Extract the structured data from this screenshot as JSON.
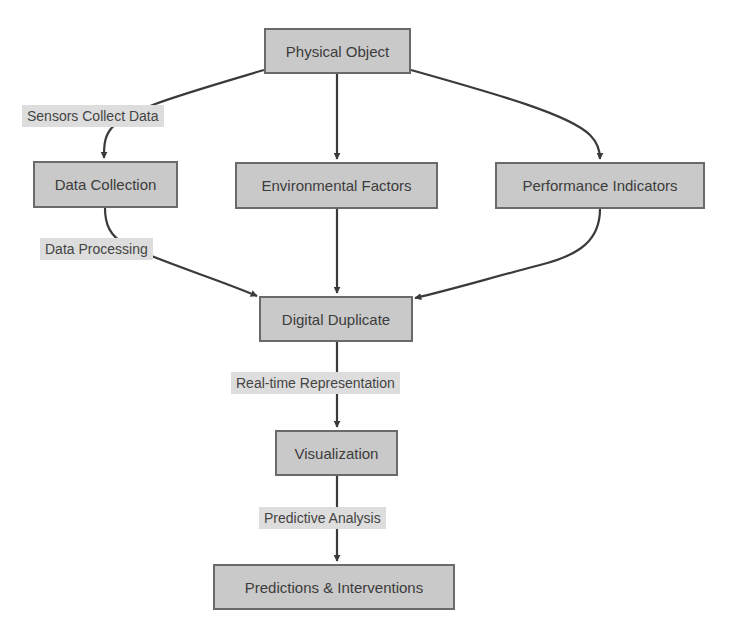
{
  "diagram": {
    "type": "flowchart",
    "colors": {
      "node_fill": "#c9c9c9",
      "node_border": "#6a6a6a",
      "label_fill": "#dddddd",
      "edge": "#3a3a3a",
      "text": "#3c3c3c"
    },
    "nodes": {
      "physical_object": "Physical Object",
      "data_collection": "Data Collection",
      "environmental_factors": "Environmental Factors",
      "performance_indicators": "Performance Indicators",
      "digital_duplicate": "Digital Duplicate",
      "visualization": "Visualization",
      "predictions_interventions": "Predictions & Interventions"
    },
    "edge_labels": {
      "sensors_collect_data": "Sensors Collect Data",
      "data_processing": "Data Processing",
      "real_time_representation": "Real-time Representation",
      "predictive_analysis": "Predictive Analysis"
    },
    "edges": [
      {
        "from": "Physical Object",
        "to": "Data Collection",
        "label": "Sensors Collect Data"
      },
      {
        "from": "Physical Object",
        "to": "Environmental Factors",
        "label": ""
      },
      {
        "from": "Physical Object",
        "to": "Performance Indicators",
        "label": ""
      },
      {
        "from": "Data Collection",
        "to": "Digital Duplicate",
        "label": "Data Processing"
      },
      {
        "from": "Environmental Factors",
        "to": "Digital Duplicate",
        "label": ""
      },
      {
        "from": "Performance Indicators",
        "to": "Digital Duplicate",
        "label": ""
      },
      {
        "from": "Digital Duplicate",
        "to": "Visualization",
        "label": "Real-time Representation"
      },
      {
        "from": "Visualization",
        "to": "Predictions & Interventions",
        "label": "Predictive Analysis"
      }
    ]
  }
}
